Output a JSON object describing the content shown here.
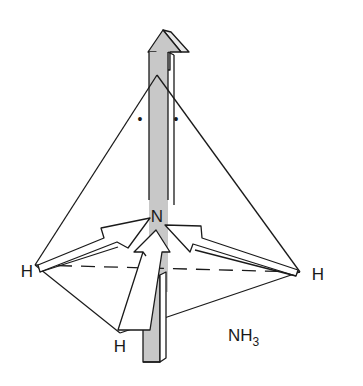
{
  "diagram": {
    "molecule_label": "NH",
    "molecule_subscript": "3",
    "central_atom": "N",
    "outer_atoms": [
      {
        "label": "H",
        "position": "left"
      },
      {
        "label": "H",
        "position": "right"
      },
      {
        "label": "H",
        "position": "front"
      }
    ],
    "lone_pair_symbol": "•",
    "colors": {
      "line": "#1a1a1a",
      "dipole_fill": "#c8c8c8",
      "background": "#ffffff"
    }
  }
}
